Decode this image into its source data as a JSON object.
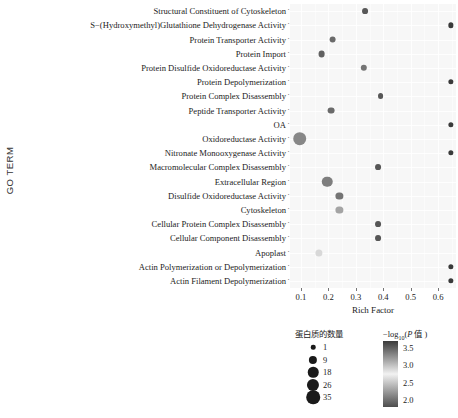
{
  "axes": {
    "y_title": "GO TERM",
    "x_title": "Rich Factor",
    "x_ticks": [
      "0.1",
      "0.2",
      "0.3",
      "0.4",
      "0.5",
      "0.6"
    ]
  },
  "legend": {
    "size_title": "蛋白质的数量",
    "color_title_prefix": "−log",
    "color_title_sub": "10",
    "color_title_open": "(",
    "color_title_italic": "P",
    "color_title_rest": " 值 )",
    "size_items": [
      {
        "label": "1",
        "value": 1
      },
      {
        "label": "9",
        "value": 9
      },
      {
        "label": "18",
        "value": 18
      },
      {
        "label": "26",
        "value": 26
      },
      {
        "label": "35",
        "value": 35
      }
    ],
    "color_ticks": [
      "3.5",
      "3.0",
      "2.5",
      "2.0"
    ],
    "color_scale_low": "#4d4d4d",
    "color_scale_mid": "#f2f2f2",
    "color_scale_high": "#3a3a3a"
  },
  "chart_data": {
    "type": "scatter",
    "title": "",
    "xlabel": "Rich Factor",
    "ylabel": "GO TERM",
    "xlim": [
      0.06,
      0.665
    ],
    "grid": true,
    "legend_position": "bottom",
    "size_field": "蛋白质的数量",
    "color_field": "−log10(P 值)",
    "color_range": [
      1.8,
      3.7
    ],
    "categories": [
      "Structural Constituent of Cytoskeleton",
      "S−(Hydroxymethyl)Glutathione Dehydrogenase Activity",
      "Protein Transporter Activity",
      "Protein Import",
      "Protein Disulfide Oxidoreductase Activity",
      "Protein Depolymerization",
      "Protein Complex Disassembly",
      "Peptide Transporter Activity",
      "OA",
      "Oxidoreductase Activity",
      "Nitronate Monooxygenase Activity",
      "Macromolecular Complex Disassembly",
      "Extracellular Region",
      "Disulfide Oxidoreductase Activity",
      "Cytoskeleton",
      "Cellular Protein Complex Disassembly",
      "Cellular Component Disassembly",
      "Apoplast",
      "Actin Polymerization or Depolymerization",
      "Actin Filament Depolymerization"
    ],
    "points": [
      {
        "category": "Structural Constituent of Cytoskeleton",
        "rich_factor": 0.335,
        "count": 3,
        "neglog10p": 3.55
      },
      {
        "category": "S−(Hydroxymethyl)Glutathione Dehydrogenase Activity",
        "rich_factor": 0.645,
        "count": 2,
        "neglog10p": 3.7
      },
      {
        "category": "Protein Transporter Activity",
        "rich_factor": 0.215,
        "count": 5,
        "neglog10p": 3.45
      },
      {
        "category": "Protein Import",
        "rich_factor": 0.175,
        "count": 5,
        "neglog10p": 3.5
      },
      {
        "category": "Protein Disulfide Oxidoreductase Activity",
        "rich_factor": 0.33,
        "count": 4,
        "neglog10p": 3.4
      },
      {
        "category": "Protein Depolymerization",
        "rich_factor": 0.645,
        "count": 2,
        "neglog10p": 3.7
      },
      {
        "category": "Protein Complex Disassembly",
        "rich_factor": 0.39,
        "count": 3,
        "neglog10p": 3.55
      },
      {
        "category": "Peptide Transporter Activity",
        "rich_factor": 0.21,
        "count": 5,
        "neglog10p": 3.45
      },
      {
        "category": "OA",
        "rich_factor": 0.645,
        "count": 2,
        "neglog10p": 3.7
      },
      {
        "category": "Oxidoreductase Activity",
        "rich_factor": 0.095,
        "count": 35,
        "neglog10p": 3.3
      },
      {
        "category": "Nitronate Monooxygenase Activity",
        "rich_factor": 0.645,
        "count": 2,
        "neglog10p": 3.7
      },
      {
        "category": "Macromolecular Complex Disassembly",
        "rich_factor": 0.38,
        "count": 3,
        "neglog10p": 3.55
      },
      {
        "category": "Extracellular Region",
        "rich_factor": 0.195,
        "count": 18,
        "neglog10p": 3.35
      },
      {
        "category": "Disulfide Oxidoreductase Activity",
        "rich_factor": 0.24,
        "count": 6,
        "neglog10p": 3.4
      },
      {
        "category": "Cytoskeleton",
        "rich_factor": 0.24,
        "count": 6,
        "neglog10p": 2.3
      },
      {
        "category": "Cellular Protein Complex Disassembly",
        "rich_factor": 0.38,
        "count": 3,
        "neglog10p": 3.55
      },
      {
        "category": "Cellular Component Disassembly",
        "rich_factor": 0.38,
        "count": 3,
        "neglog10p": 3.55
      },
      {
        "category": "Apoplast",
        "rich_factor": 0.165,
        "count": 6,
        "neglog10p": 2.6
      },
      {
        "category": "Actin Polymerization or Depolymerization",
        "rich_factor": 0.645,
        "count": 2,
        "neglog10p": 3.7
      },
      {
        "category": "Actin Filament Depolymerization",
        "rich_factor": 0.645,
        "count": 2,
        "neglog10p": 3.7
      }
    ]
  }
}
